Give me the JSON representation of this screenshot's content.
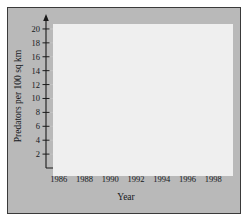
{
  "chart_data": {
    "type": "line",
    "title": "",
    "xlabel": "Year",
    "ylabel": "Predators per 100 sq km",
    "x_axis_variable": "t",
    "xlim": [
      1985,
      1998.6
    ],
    "ylim": [
      0,
      21
    ],
    "grid": true,
    "legend_position": "inline-annotation",
    "x_tick_labels": [
      "1986",
      "1988",
      "1990",
      "1992",
      "1994",
      "1996",
      "1998"
    ],
    "x_tick_values": [
      1986,
      1988,
      1990,
      1992,
      1994,
      1996,
      1998
    ],
    "y_tick_labels": [
      "2",
      "4",
      "6",
      "8",
      "10",
      "12",
      "14",
      "16",
      "18",
      "20"
    ],
    "y_tick_values": [
      2,
      4,
      6,
      8,
      10,
      12,
      14,
      16,
      18,
      20
    ],
    "x": [
      1987,
      1988,
      1989,
      1990,
      1991,
      1992,
      1993,
      1994,
      1995,
      1996,
      1997
    ],
    "series": [
      {
        "name": "Lynx",
        "color": "#0d0d0d",
        "values": [
          2.9,
          4.6,
          14.3,
          17.3,
          8.0,
          4.3,
          2.0,
          2.7,
          2.7,
          5.5,
          8.7
        ]
      },
      {
        "name": "Coyote",
        "color": "#6e6e6e",
        "values": [
          2.3,
          3.5,
          5.8,
          8.6,
          4.7,
          2.7,
          1.5,
          1.5,
          1.5,
          3.5,
          4.7
        ]
      }
    ],
    "annotations": [
      {
        "text": "Lynx",
        "x": 1991.15,
        "y": 12.6
      },
      {
        "text": "Coyote",
        "x": 1992.1,
        "y": 7.1
      }
    ]
  }
}
